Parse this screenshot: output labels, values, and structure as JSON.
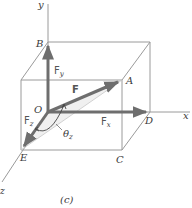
{
  "figure": {
    "caption": "(c)",
    "axes": {
      "x": "x",
      "y": "y",
      "z": "z"
    },
    "points": {
      "origin": "O",
      "A": "A",
      "B": "B",
      "C": "C",
      "D": "D",
      "E": "E"
    },
    "vectors": {
      "F": "F",
      "Fx": "F",
      "Fx_sub": "x",
      "Fy": "F",
      "Fy_sub": "y",
      "Fz": "F",
      "Fz_sub": "z"
    },
    "angle": {
      "symbol": "θ",
      "sub": "z"
    },
    "colors": {
      "box_line": "#9a9a9a",
      "vector": "#6e6e6e",
      "angle_fill": "#e2e2e2"
    }
  }
}
